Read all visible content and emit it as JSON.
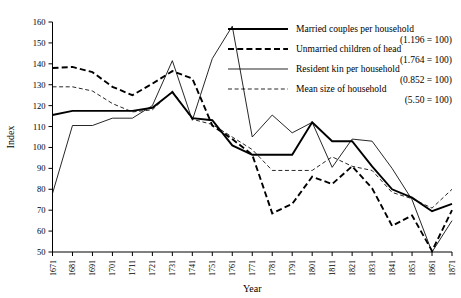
{
  "chart_data": {
    "type": "line",
    "title": "",
    "xlabel": "Year",
    "ylabel": "Index",
    "ylim": [
      50,
      160
    ],
    "xlim": [
      1671,
      1871
    ],
    "ytick_step": 10,
    "grid": false,
    "legend_position": "top-right",
    "ytick_labels": [
      "160",
      "150",
      "140",
      "130",
      "120",
      "110",
      "100",
      "90",
      "80",
      "70",
      "60",
      "50"
    ],
    "categories": [
      1671,
      1681,
      1691,
      1701,
      1711,
      1721,
      1731,
      1741,
      1751,
      1761,
      1771,
      1781,
      1791,
      1801,
      1811,
      1821,
      1831,
      1841,
      1851,
      1861,
      1871
    ],
    "xtick_labels": [
      "1671",
      "1681",
      "1691",
      "1701",
      "1711",
      "1721",
      "1731",
      "1741",
      "1751",
      "1761",
      "1771",
      "1781",
      "1791",
      "1801",
      "1811",
      "1821",
      "1831",
      "1841",
      "1851",
      "1861",
      "1871"
    ],
    "series": [
      {
        "name": "Married couples per household",
        "base": "(1.196 = 100)",
        "style": "solid-thick",
        "values": [
          115.5,
          117.5,
          117.5,
          117.5,
          117.5,
          119,
          126.5,
          114,
          113,
          101,
          96.5,
          96.5,
          96.5,
          112,
          103,
          103,
          91,
          80,
          76,
          69.5,
          73
        ]
      },
      {
        "name": "Unmarried children of head",
        "base": "(1.764 = 100)",
        "style": "dashed-thick",
        "values": [
          138,
          138.5,
          136,
          129,
          125,
          130.5,
          136.5,
          133,
          110.5,
          104,
          96.5,
          68.5,
          73,
          86,
          82.5,
          91,
          80.5,
          62.5,
          67.5,
          50.5,
          70
        ]
      },
      {
        "name": "Resident kin per household",
        "base": "(0.852 = 100)",
        "style": "solid-thin",
        "values": [
          78,
          110.5,
          110.5,
          114,
          114,
          120,
          141.5,
          113,
          142.5,
          158,
          105,
          115.5,
          107,
          112,
          90.5,
          104,
          103,
          90,
          75,
          50,
          65
        ]
      },
      {
        "name": "Mean size of household",
        "base": "(5.50 = 100)",
        "style": "dashed-thin",
        "values": [
          129,
          129,
          127,
          121,
          117,
          118,
          127,
          113.5,
          111,
          105,
          99,
          89,
          89,
          89,
          95.5,
          91,
          89,
          78.5,
          75.5,
          71,
          80
        ]
      }
    ]
  },
  "legend": {
    "items": [
      {
        "label": "Married couples per household",
        "sub": "(1.196 = 100)"
      },
      {
        "label": "Unmarried children of head",
        "sub": "(1.764 = 100)"
      },
      {
        "label": "Resident kin per household",
        "sub": "(0.852 = 100)"
      },
      {
        "label": "Mean size of household",
        "sub": "(5.50 = 100)"
      }
    ]
  },
  "axes": {
    "y_title": "Index",
    "x_title": "Year"
  }
}
